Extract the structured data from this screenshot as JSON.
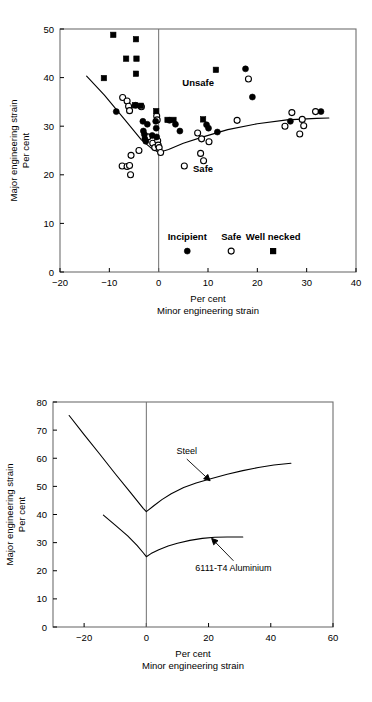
{
  "figures": [
    {
      "id": "forming-limit-diagram-experimental",
      "axis": {
        "xlabel_line1": "Per cent",
        "xlabel_line2": "Minor engineering strain",
        "ylabel_line1": "Major engineering strain",
        "ylabel_line2": "Per cent",
        "xticks": [
          -20,
          -10,
          0,
          10,
          20,
          30,
          40
        ],
        "yticks": [
          0,
          10,
          20,
          30,
          40,
          50
        ],
        "xlim": [
          -20,
          40
        ],
        "ylim": [
          0,
          50
        ],
        "grid": false
      },
      "region_labels": [
        {
          "text": "Unsafe",
          "x": 8.0,
          "y": 38.2
        },
        {
          "text": "Safe",
          "x": 9.0,
          "y": 20.5
        }
      ],
      "legend": {
        "position": "inside-bottom",
        "y_label": 6.6,
        "y_marker": 4.3,
        "entries": [
          {
            "label": "Incipient",
            "marker": "filled-circle",
            "x": 5.8
          },
          {
            "label": "Safe",
            "marker": "open-circle",
            "x": 14.7
          },
          {
            "label": "Well necked",
            "marker": "filled-square",
            "x": 23.2
          }
        ]
      }
    },
    {
      "id": "forming-limit-diagram-steel-vs-aluminium",
      "axis": {
        "xlabel_line1": "Per cent",
        "xlabel_line2": "Minor engineering strain",
        "ylabel_line1": "Major engineering strain",
        "ylabel_line2": "Per cent",
        "xticks": [
          -20,
          0,
          20,
          40,
          60
        ],
        "yticks": [
          0,
          10,
          20,
          30,
          40,
          50,
          60,
          70,
          80
        ],
        "xlim": [
          -30,
          60
        ],
        "ylim": [
          0,
          80
        ],
        "grid": false
      },
      "annotations": [
        {
          "text": "Steel",
          "label_x": 13.0,
          "label_y": 61.5,
          "arrow_to_x": 20.5,
          "arrow_to_y": 52.0
        },
        {
          "text": "6111-T4 Aluminium",
          "label_x": 28.0,
          "label_y": 20.0,
          "arrow_to_x": 21.0,
          "arrow_to_y": 31.5
        }
      ]
    }
  ],
  "chart_data": [
    {
      "type": "scatter",
      "title": "",
      "xlabel": "Minor engineering strain (Per cent)",
      "ylabel": "Major engineering strain (Per cent)",
      "xlim": [
        -20,
        40
      ],
      "ylim": [
        0,
        50
      ],
      "xticks": [
        -20,
        -10,
        0,
        10,
        20,
        30,
        40
      ],
      "yticks": [
        0,
        10,
        20,
        30,
        40,
        50
      ],
      "grid": false,
      "legend": [
        "Incipient",
        "Safe",
        "Well necked"
      ],
      "annotations": [
        "Unsafe",
        "Safe"
      ],
      "series": [
        {
          "name": "Incipient",
          "marker": "filled-circle",
          "points": [
            [
              -8.6,
              33.0
            ],
            [
              -4.7,
              34.3
            ],
            [
              -3.2,
              31.0
            ],
            [
              -3.1,
              29.0
            ],
            [
              -2.9,
              28.3
            ],
            [
              -2.8,
              27.4
            ],
            [
              -2.6,
              26.9
            ],
            [
              -2.3,
              30.4
            ],
            [
              -1.3,
              28.1
            ],
            [
              -0.6,
              31.0
            ],
            [
              -0.5,
              29.6
            ],
            [
              -0.4,
              27.8
            ],
            [
              2.2,
              31.2
            ],
            [
              3.4,
              30.4
            ],
            [
              4.3,
              29.0
            ],
            [
              9.7,
              30.3
            ],
            [
              10.1,
              29.6
            ],
            [
              11.9,
              28.8
            ],
            [
              17.6,
              41.8
            ],
            [
              19.0,
              36.0
            ],
            [
              26.7,
              31.0
            ],
            [
              32.9,
              33.0
            ]
          ]
        },
        {
          "name": "Safe",
          "marker": "open-circle",
          "points": [
            [
              -7.3,
              35.9
            ],
            [
              -6.4,
              35.2
            ],
            [
              -6.1,
              34.1
            ],
            [
              -5.9,
              33.2
            ],
            [
              -5.6,
              24.0
            ],
            [
              -7.4,
              21.8
            ],
            [
              -6.4,
              21.7
            ],
            [
              -5.9,
              21.9
            ],
            [
              -5.7,
              20.0
            ],
            [
              -4.0,
              25.0
            ],
            [
              -3.5,
              34.0
            ],
            [
              -2.2,
              27.8
            ],
            [
              -1.2,
              26.5
            ],
            [
              -0.8,
              25.6
            ],
            [
              -0.4,
              32.1
            ],
            [
              -0.3,
              31.3
            ],
            [
              -0.2,
              27.0
            ],
            [
              -0.1,
              26.1
            ],
            [
              0.1,
              25.6
            ],
            [
              0.4,
              24.6
            ],
            [
              5.2,
              21.8
            ],
            [
              7.9,
              28.6
            ],
            [
              8.5,
              24.4
            ],
            [
              8.7,
              27.4
            ],
            [
              9.1,
              22.9
            ],
            [
              10.2,
              26.8
            ],
            [
              15.9,
              31.2
            ],
            [
              18.2,
              39.7
            ],
            [
              25.6,
              30.0
            ],
            [
              27.0,
              32.8
            ],
            [
              28.6,
              28.4
            ],
            [
              29.1,
              31.4
            ],
            [
              29.4,
              30.1
            ],
            [
              31.8,
              33.0
            ]
          ]
        },
        {
          "name": "Well necked",
          "marker": "filled-square",
          "points": [
            [
              -9.2,
              48.8
            ],
            [
              -11.1,
              39.9
            ],
            [
              -6.6,
              43.9
            ],
            [
              -4.6,
              47.9
            ],
            [
              -4.5,
              43.9
            ],
            [
              -4.6,
              40.8
            ],
            [
              -4.8,
              34.3
            ],
            [
              -3.6,
              34.2
            ],
            [
              -0.5,
              33.1
            ],
            [
              1.8,
              31.3
            ],
            [
              3.0,
              31.3
            ],
            [
              9.0,
              31.4
            ],
            [
              11.6,
              41.6
            ],
            [
              23.2,
              4.3
            ]
          ]
        }
      ],
      "limit_curve": {
        "name": "forming limit curve",
        "points": [
          [
            -14.6,
            40.3
          ],
          [
            -11.0,
            36.4
          ],
          [
            -7.0,
            31.5
          ],
          [
            -3.5,
            27.2
          ],
          [
            -1.5,
            25.5
          ],
          [
            0.0,
            24.6
          ],
          [
            2.0,
            25.2
          ],
          [
            5.0,
            26.5
          ],
          [
            9.0,
            27.8
          ],
          [
            14.0,
            29.3
          ],
          [
            20.0,
            30.5
          ],
          [
            26.0,
            31.3
          ],
          [
            32.0,
            31.6
          ],
          [
            34.5,
            31.7
          ]
        ]
      }
    },
    {
      "type": "line",
      "title": "",
      "xlabel": "Minor engineering strain (Per cent)",
      "ylabel": "Major engineering strain (Per cent)",
      "xlim": [
        -30,
        60
      ],
      "ylim": [
        0,
        80
      ],
      "xticks": [
        -20,
        0,
        20,
        40,
        60
      ],
      "yticks": [
        0,
        10,
        20,
        30,
        40,
        50,
        60,
        70,
        80
      ],
      "grid": false,
      "legend": [
        "Steel",
        "6111-T4 Aluminium"
      ],
      "series": [
        {
          "name": "Steel",
          "points": [
            [
              -24.8,
              75.2
            ],
            [
              -20.0,
              68.4
            ],
            [
              -15.0,
              61.5
            ],
            [
              -10.0,
              54.5
            ],
            [
              -5.0,
              47.7
            ],
            [
              -1.0,
              42.2
            ],
            [
              0.0,
              41.0
            ],
            [
              2.5,
              43.2
            ],
            [
              5.0,
              45.3
            ],
            [
              8.0,
              47.4
            ],
            [
              12.0,
              49.6
            ],
            [
              16.0,
              51.2
            ],
            [
              21.0,
              52.8
            ],
            [
              26.0,
              54.3
            ],
            [
              31.0,
              55.6
            ],
            [
              36.0,
              56.7
            ],
            [
              41.0,
              57.6
            ],
            [
              46.5,
              58.2
            ]
          ]
        },
        {
          "name": "6111-T4 Aluminium",
          "points": [
            [
              -13.8,
              39.8
            ],
            [
              -10.0,
              36.2
            ],
            [
              -6.0,
              32.4
            ],
            [
              -3.0,
              29.0
            ],
            [
              -1.0,
              26.4
            ],
            [
              0.0,
              25.0
            ],
            [
              1.5,
              26.1
            ],
            [
              4.0,
              27.5
            ],
            [
              7.0,
              28.8
            ],
            [
              10.0,
              29.8
            ],
            [
              14.0,
              30.8
            ],
            [
              18.0,
              31.5
            ],
            [
              22.0,
              31.9
            ],
            [
              26.0,
              32.0
            ],
            [
              31.0,
              32.0
            ]
          ]
        }
      ]
    }
  ]
}
